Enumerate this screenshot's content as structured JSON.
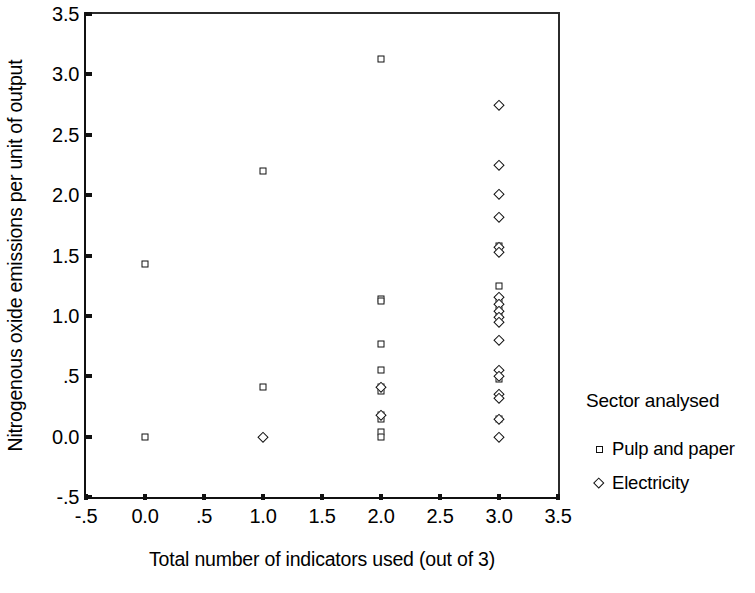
{
  "chart_data": {
    "type": "scatter",
    "title": "",
    "xlabel": "Total number of indicators used (out of 3)",
    "ylabel": "Nitrogenous oxide emissions per unit of output",
    "xlim": [
      -0.5,
      3.5
    ],
    "ylim": [
      -0.5,
      3.5
    ],
    "xticks": [
      -0.5,
      0.0,
      0.5,
      1.0,
      1.5,
      2.0,
      2.5,
      3.0,
      3.5
    ],
    "xticklabels": [
      "-.5",
      "0.0",
      ".5",
      "1.0",
      "1.5",
      "2.0",
      "2.5",
      "3.0",
      "3.5"
    ],
    "yticks": [
      -0.5,
      0.0,
      0.5,
      1.0,
      1.5,
      2.0,
      2.5,
      3.0,
      3.5
    ],
    "yticklabels": [
      "-.5",
      "0.0",
      ".5",
      "1.0",
      "1.5",
      "2.0",
      "2.5",
      "3.0",
      "3.5"
    ],
    "grid": false,
    "legend_position": "right",
    "legend_title": "Sector analysed",
    "series": [
      {
        "name": "Pulp and paper",
        "marker": "square",
        "points": [
          [
            0.0,
            1.43
          ],
          [
            0.0,
            0.0
          ],
          [
            1.0,
            2.2
          ],
          [
            1.0,
            0.41
          ],
          [
            2.0,
            3.13
          ],
          [
            2.0,
            1.14
          ],
          [
            2.0,
            1.12
          ],
          [
            2.0,
            0.77
          ],
          [
            2.0,
            0.55
          ],
          [
            2.0,
            0.41
          ],
          [
            2.0,
            0.38
          ],
          [
            2.0,
            0.18
          ],
          [
            2.0,
            0.15
          ],
          [
            2.0,
            0.04
          ],
          [
            2.0,
            0.0
          ],
          [
            3.0,
            1.58
          ],
          [
            3.0,
            1.55
          ],
          [
            3.0,
            1.25
          ],
          [
            3.0,
            1.14
          ],
          [
            3.0,
            1.05
          ],
          [
            3.0,
            1.0
          ],
          [
            3.0,
            0.48
          ],
          [
            3.0,
            0.33
          ],
          [
            3.0,
            0.15
          ]
        ]
      },
      {
        "name": "Electricity",
        "marker": "diamond",
        "points": [
          [
            1.0,
            0.0
          ],
          [
            2.0,
            0.41
          ],
          [
            2.0,
            0.18
          ],
          [
            3.0,
            2.75
          ],
          [
            3.0,
            2.25
          ],
          [
            3.0,
            2.01
          ],
          [
            3.0,
            1.82
          ],
          [
            3.0,
            1.57
          ],
          [
            3.0,
            1.53
          ],
          [
            3.0,
            1.16
          ],
          [
            3.0,
            1.1
          ],
          [
            3.0,
            1.04
          ],
          [
            3.0,
            0.99
          ],
          [
            3.0,
            0.95
          ],
          [
            3.0,
            0.8
          ],
          [
            3.0,
            0.55
          ],
          [
            3.0,
            0.5
          ],
          [
            3.0,
            0.35
          ],
          [
            3.0,
            0.32
          ],
          [
            3.0,
            0.15
          ],
          [
            3.0,
            0.0
          ]
        ]
      }
    ]
  },
  "legend": {
    "title": "Sector analysed",
    "entries": [
      {
        "label": "Pulp and paper",
        "marker": "square"
      },
      {
        "label": "Electricity",
        "marker": "diamond"
      }
    ]
  },
  "axes": {
    "x_title": "Total number of indicators used (out of 3)",
    "y_title": "Nitrogenous oxide emissions per unit of output"
  },
  "colors": {
    "marker_stroke": "#111111",
    "marker_fill": "#ffffff",
    "axis": "#111111",
    "background": "#ffffff"
  }
}
